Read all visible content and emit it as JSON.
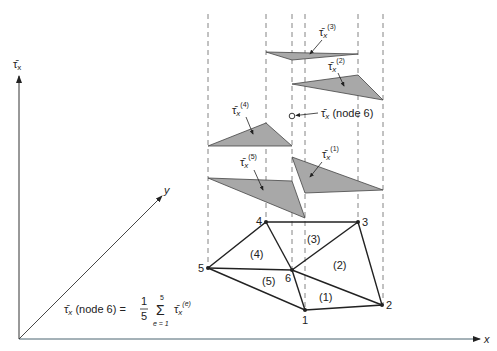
{
  "axes": {
    "vertical_label": "τ̄",
    "vertical_sub": "x",
    "horizontal_label": "x",
    "depth_label": "y"
  },
  "nodes": [
    {
      "id": "1",
      "x": 305,
      "y": 310
    },
    {
      "id": "2",
      "x": 382,
      "y": 305
    },
    {
      "id": "3",
      "x": 358,
      "y": 222
    },
    {
      "id": "4",
      "x": 266,
      "y": 222
    },
    {
      "id": "5",
      "x": 208,
      "y": 268
    },
    {
      "id": "6",
      "x": 292,
      "y": 270
    }
  ],
  "elements": [
    {
      "id": "(1)",
      "nodes": [
        "6",
        "1",
        "2"
      ]
    },
    {
      "id": "(2)",
      "nodes": [
        "6",
        "2",
        "3"
      ]
    },
    {
      "id": "(3)",
      "nodes": [
        "6",
        "3",
        "4"
      ]
    },
    {
      "id": "(4)",
      "nodes": [
        "6",
        "4",
        "5"
      ]
    },
    {
      "id": "(5)",
      "nodes": [
        "6",
        "5",
        "1"
      ]
    }
  ],
  "element_labels": {
    "e1": "(1)",
    "e2": "(2)",
    "e3": "(3)",
    "e4": "(4)",
    "e5": "(5)"
  },
  "node_labels": {
    "n1": "1",
    "n2": "2",
    "n3": "3",
    "n4": "4",
    "n5": "5",
    "n6": "6"
  },
  "stress_labels": {
    "t1_sup": "(1)",
    "t2_sup": "(2)",
    "t3_sup": "(3)",
    "t4_sup": "(4)",
    "t5_sup": "(5)",
    "base": "τ̄",
    "sub": "x"
  },
  "node6_callout": {
    "symbol": "τ̄",
    "sub": "x",
    "text": " (node 6)"
  },
  "formula": {
    "lhs_symbol": "τ̄",
    "lhs_sub": "x",
    "lhs_text": " (node 6) = ",
    "frac_num": "1",
    "frac_den": "5",
    "sum_symbol": "Σ",
    "sum_upper": "5",
    "sum_lower": "e = 1",
    "term_symbol": "τ̄",
    "term_sub": "x",
    "term_sup": "(e)"
  },
  "colors": {
    "line": "#222222",
    "fill": "#a8a8a8",
    "dash": "#666666",
    "axis": "#333333"
  }
}
